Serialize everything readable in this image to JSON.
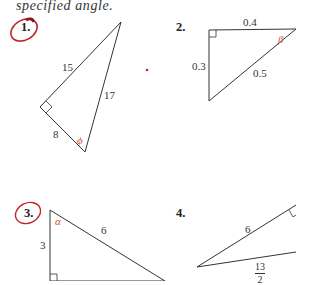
{
  "heading": "specified angle.",
  "problems": [
    {
      "number": "1.",
      "circled": true,
      "sides": {
        "hypotenuse": "17",
        "leg_a": "15",
        "leg_b": "8"
      },
      "angle": "ϕ"
    },
    {
      "number": "2.",
      "circled": false,
      "sides": {
        "top": "0.4",
        "left": "0.3",
        "hypotenuse": "0.5"
      },
      "angle": "β"
    },
    {
      "number": "3.",
      "circled": true,
      "sides": {
        "left": "3",
        "hypotenuse": "6"
      },
      "angle": "α"
    },
    {
      "number": "4.",
      "circled": false,
      "sides": {
        "upper": "6",
        "lower_numerator": "13",
        "lower_denominator": "2"
      }
    }
  ],
  "colors": {
    "line": "#333333",
    "angle": "#d2553a",
    "circle": "#c0262b"
  }
}
